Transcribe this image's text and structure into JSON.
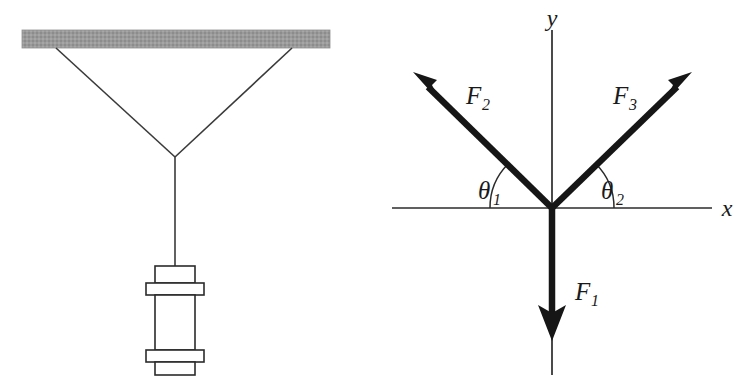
{
  "figure": {
    "background_color": "#ffffff",
    "ink_color": "#1a1a1a"
  },
  "left_panel": {
    "name": "hanging-weight-sketch",
    "ceiling": {
      "label": "ceiling-support-bar",
      "fill_color": "#9a9a9a",
      "x": 22,
      "y": 30,
      "width": 308,
      "height": 18
    },
    "cables": [
      {
        "label": "left-cable",
        "x1": 56,
        "y1": 48,
        "x2": 175,
        "y2": 157
      },
      {
        "label": "right-cable",
        "x1": 292,
        "y1": 48,
        "x2": 175,
        "y2": 157
      },
      {
        "label": "vertical-cable",
        "x1": 175,
        "y1": 157,
        "x2": 175,
        "y2": 266
      }
    ],
    "weight": {
      "label": "suspended-weight",
      "top_cap": {
        "x": 155,
        "y": 266,
        "width": 40,
        "height": 17
      },
      "top_flange": {
        "x": 146,
        "y": 283,
        "width": 58,
        "height": 12
      },
      "body": {
        "x": 155,
        "y": 295,
        "width": 40,
        "height": 55
      },
      "bottom_flange": {
        "x": 146,
        "y": 350,
        "width": 58,
        "height": 12
      },
      "bottom_cap": {
        "x": 155,
        "y": 362,
        "width": 40,
        "height": 13
      }
    }
  },
  "right_panel": {
    "name": "free-body-force-diagram",
    "origin": {
      "x": 552,
      "y": 208
    },
    "axes": [
      {
        "name": "x-axis",
        "label": "x",
        "x1": 392,
        "y1": 208,
        "x2": 712,
        "y2": 208
      },
      {
        "name": "y-axis",
        "label": "y",
        "x1": 552,
        "y1": 30,
        "x2": 552,
        "y2": 375
      }
    ],
    "axis_labels": {
      "x": "x",
      "y": "y"
    },
    "vectors": [
      {
        "name": "force-vector-F1",
        "label": "F",
        "subscript": "1",
        "direction": "down",
        "tail": {
          "x": 552,
          "y": 208
        },
        "tip": {
          "x": 552,
          "y": 338
        },
        "label_pos": {
          "x": 575,
          "y": 300
        }
      },
      {
        "name": "force-vector-F2",
        "label": "F",
        "subscript": "2",
        "direction": "upper-left",
        "tail": {
          "x": 552,
          "y": 208
        },
        "tip": {
          "x": 413,
          "y": 72
        },
        "label_pos": {
          "x": 466,
          "y": 104
        }
      },
      {
        "name": "force-vector-F3",
        "label": "F",
        "subscript": "3",
        "direction": "upper-right",
        "tail": {
          "x": 552,
          "y": 208
        },
        "tip": {
          "x": 692,
          "y": 72
        },
        "label_pos": {
          "x": 613,
          "y": 104
        }
      }
    ],
    "angles": [
      {
        "name": "angle-theta1",
        "label": "θ",
        "subscript": "1",
        "between": "F2-and-negative-x-axis",
        "arc_radius": 62,
        "label_pos": {
          "x": 484,
          "y": 199
        }
      },
      {
        "name": "angle-theta2",
        "label": "θ",
        "subscript": "2",
        "between": "F3-and-positive-x-axis",
        "arc_radius": 62,
        "label_pos": {
          "x": 601,
          "y": 199
        }
      }
    ]
  }
}
